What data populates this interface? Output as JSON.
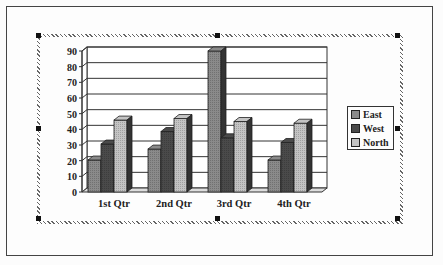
{
  "chart_data": {
    "type": "bar",
    "style": "3d-clustered-column",
    "title": "",
    "xlabel": "",
    "ylabel": "",
    "categories": [
      "1st Qtr",
      "2nd Qtr",
      "3rd Qtr",
      "4th Qtr"
    ],
    "series": [
      {
        "name": "East",
        "values": [
          20.4,
          27.4,
          90,
          20.4
        ],
        "color": "#8a8a8a"
      },
      {
        "name": "West",
        "values": [
          30.6,
          38.6,
          34.6,
          31.6
        ],
        "color": "#4a4a4a"
      },
      {
        "name": "North",
        "values": [
          45.9,
          46.9,
          45,
          43.9
        ],
        "color": "#c4c4c4"
      }
    ],
    "ylim": [
      0,
      90
    ],
    "yticks": [
      0,
      10,
      20,
      30,
      40,
      50,
      60,
      70,
      80,
      90
    ],
    "grid": true,
    "legend_position": "right"
  },
  "legend": {
    "items": [
      "East",
      "West",
      "North"
    ]
  },
  "axis": {
    "yticks": [
      "90",
      "80",
      "70",
      "60",
      "50",
      "40",
      "30",
      "20",
      "10",
      "0"
    ],
    "xticks": [
      "1st Qtr",
      "2nd Qtr",
      "3rd Qtr",
      "4th Qtr"
    ]
  }
}
